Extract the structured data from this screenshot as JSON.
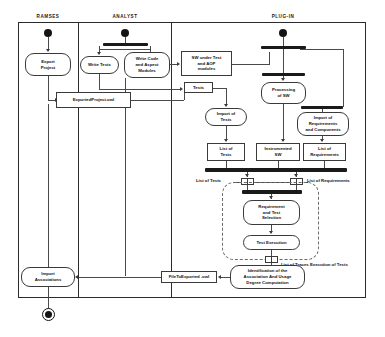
{
  "diagram": {
    "type": "uml-activity-diagram",
    "title": "",
    "lanes": [
      {
        "id": "ramses",
        "label": "RAMSES"
      },
      {
        "id": "analyst",
        "label": "ANALYST"
      },
      {
        "id": "plugin",
        "label": "PLUG-IN"
      }
    ],
    "activities": [
      {
        "id": "export-project",
        "label": "Export\nProject",
        "lane": "ramses"
      },
      {
        "id": "write-tests",
        "label": "Write Tests",
        "lane": "analyst"
      },
      {
        "id": "write-code",
        "label": "Write Code\nand Aspect\nModules",
        "lane": "analyst"
      },
      {
        "id": "processing-of-sw",
        "label": "Processing\nof SW",
        "lane": "plugin"
      },
      {
        "id": "import-of-tests",
        "label": "Import of\nTests",
        "lane": "plugin"
      },
      {
        "id": "import-of-requirements",
        "label": "Import of\nRequirements\nand Components",
        "lane": "plugin"
      },
      {
        "id": "req-test-selection",
        "label": "Requirement\nand Test\nSelection",
        "lane": "plugin"
      },
      {
        "id": "test-execution",
        "label": "Test Execution",
        "lane": "plugin"
      },
      {
        "id": "identification",
        "label": "Identification of the\nAssociation And Usage\nDegree Computation",
        "lane": "plugin"
      },
      {
        "id": "import-associations",
        "label": "Import\nAssociations",
        "lane": "ramses"
      }
    ],
    "objects": [
      {
        "id": "sw-under-test",
        "label": "SW under Test\nand AOP\nmodules"
      },
      {
        "id": "tests",
        "label": "Tests"
      },
      {
        "id": "exported-project-owl",
        "label": "ExportedProject.owl"
      },
      {
        "id": "list-of-tests",
        "label": "List of\nTests"
      },
      {
        "id": "instrumented-sw",
        "label": "Instrumented\nSW"
      },
      {
        "id": "list-of-requirements",
        "label": "List of\nRequirements"
      },
      {
        "id": "file-to-exported-owl",
        "label": "FileToExported .owl"
      }
    ],
    "flow_labels": [
      {
        "id": "pin-list-of-tests",
        "label": "List of Tests"
      },
      {
        "id": "pin-list-of-requirements",
        "label": "List of Requirements"
      },
      {
        "id": "traces-label",
        "label": "List of Traces Execution of Tests"
      }
    ],
    "nodes": {
      "initial_ramses": "start-node",
      "initial_analyst": "start-node",
      "initial_plugin": "start-node",
      "final": "end-node",
      "fork_analyst": "fork-bar",
      "fork_plugin_top": "fork-bar",
      "fork_plugin_mid": "fork-bar",
      "join_plugin": "join-bar",
      "join_loop": "join-bar"
    },
    "colors": {
      "stroke": "#3a3a3a",
      "bar": "#1a1a1a",
      "background": "#ffffff",
      "dashed": "#6a6a6a"
    }
  }
}
